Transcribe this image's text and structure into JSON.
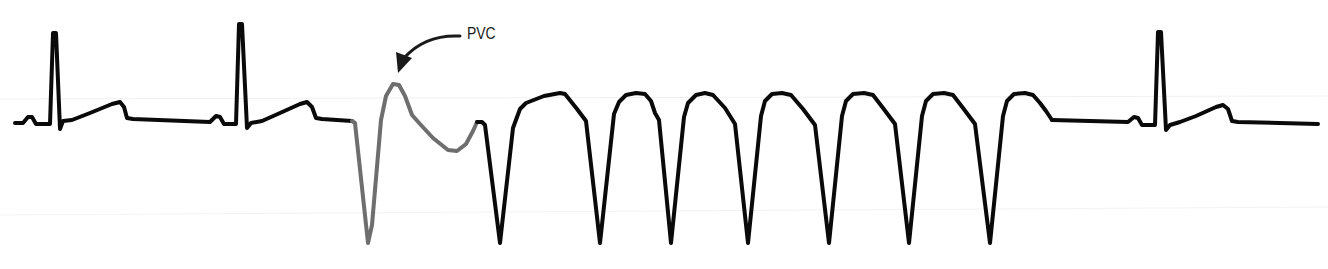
{
  "figure": {
    "annotation": {
      "label": "PVC",
      "target": "premature ventricular contraction"
    },
    "rhythm_segments": [
      {
        "name": "normal sinus beat",
        "count": 2
      },
      {
        "name": "PVC",
        "count": 1
      },
      {
        "name": "ventricular tachycardia run",
        "count": 7
      },
      {
        "name": "normal sinus beat",
        "count": 1
      }
    ],
    "colors": {
      "trace": "#0a0a0a",
      "pvc_trace": "#6e6e6e",
      "label": "#1a1a1a"
    },
    "caption": ""
  }
}
